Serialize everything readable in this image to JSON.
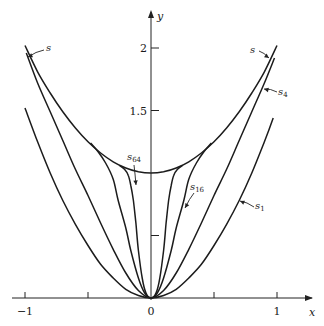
{
  "chart_data": {
    "type": "line",
    "title": "",
    "xlabel": "x",
    "ylabel": "y",
    "xlim": [
      -1,
      1
    ],
    "ylim": [
      0,
      2.1
    ],
    "grid": false,
    "legend": "none (inline arrow labels)",
    "x_ticks": [
      {
        "value": -1,
        "label": "−1"
      },
      {
        "value": -0.5,
        "label": ""
      },
      {
        "value": 0,
        "label": "0"
      },
      {
        "value": 0.5,
        "label": ""
      },
      {
        "value": 1,
        "label": "1"
      }
    ],
    "y_ticks": [
      {
        "value": 0.5,
        "label": ""
      },
      {
        "value": 1.5,
        "label": "1.5"
      },
      {
        "value": 2,
        "label": "2"
      }
    ],
    "series": [
      {
        "name": "s",
        "label_base": "s",
        "label_sub": "",
        "description": "limit / envelope curve",
        "x": [
          -1,
          -0.9,
          -0.8,
          -0.7,
          -0.6,
          -0.5,
          -0.4,
          -0.3,
          -0.2,
          -0.1,
          0,
          0.1,
          0.2,
          0.3,
          0.4,
          0.5,
          0.6,
          0.7,
          0.8,
          0.9,
          1
        ],
        "y": [
          2.02,
          1.81,
          1.64,
          1.49,
          1.36,
          1.25,
          1.16,
          1.09,
          1.04,
          1.01,
          1.0,
          1.01,
          1.04,
          1.09,
          1.16,
          1.25,
          1.36,
          1.49,
          1.64,
          1.81,
          2.02
        ]
      },
      {
        "name": "s4",
        "label_base": "s",
        "label_sub": "4",
        "x": [
          -0.99,
          -0.9,
          -0.8,
          -0.7,
          -0.6,
          -0.5,
          -0.4,
          -0.3,
          -0.2,
          -0.1,
          0,
          0.1,
          0.2,
          0.3,
          0.4,
          0.5,
          0.6,
          0.7,
          0.8,
          0.9,
          0.98
        ],
        "y": [
          1.96,
          1.72,
          1.49,
          1.26,
          1.03,
          0.82,
          0.6,
          0.39,
          0.2,
          0.06,
          0,
          0.06,
          0.2,
          0.39,
          0.6,
          0.82,
          1.03,
          1.26,
          1.49,
          1.72,
          1.92
        ]
      },
      {
        "name": "s16",
        "label_base": "s",
        "label_sub": "16",
        "x": [
          -0.48,
          -0.42,
          -0.36,
          -0.3,
          -0.26,
          -0.2,
          -0.16,
          -0.1,
          -0.05,
          0,
          0.05,
          0.1,
          0.16,
          0.2,
          0.26,
          0.3,
          0.36,
          0.42,
          0.48
        ],
        "y": [
          1.24,
          1.17,
          1.08,
          0.95,
          0.78,
          0.56,
          0.38,
          0.16,
          0.04,
          0,
          0.04,
          0.16,
          0.38,
          0.56,
          0.78,
          0.95,
          1.08,
          1.17,
          1.24
        ]
      },
      {
        "name": "s64",
        "label_base": "s",
        "label_sub": "64",
        "x": [
          -0.25,
          -0.21,
          -0.18,
          -0.16,
          -0.14,
          -0.12,
          -0.1,
          -0.07,
          -0.04,
          0,
          0.04,
          0.07,
          0.1,
          0.12,
          0.14,
          0.16,
          0.18,
          0.21,
          0.25
        ],
        "y": [
          1.06,
          1.03,
          0.98,
          0.9,
          0.78,
          0.6,
          0.38,
          0.16,
          0.04,
          0,
          0.04,
          0.16,
          0.38,
          0.6,
          0.78,
          0.9,
          0.98,
          1.03,
          1.06
        ]
      },
      {
        "name": "s1",
        "label_base": "s",
        "label_sub": "1",
        "x": [
          -1,
          -0.9,
          -0.8,
          -0.7,
          -0.6,
          -0.5,
          -0.4,
          -0.3,
          -0.2,
          -0.1,
          0,
          0.1,
          0.2,
          0.3,
          0.4,
          0.5,
          0.6,
          0.7,
          0.8,
          0.9,
          0.97
        ],
        "y": [
          1.52,
          1.25,
          1.0,
          0.78,
          0.59,
          0.42,
          0.27,
          0.16,
          0.07,
          0.02,
          0,
          0.02,
          0.07,
          0.16,
          0.27,
          0.42,
          0.59,
          0.78,
          1.0,
          1.25,
          1.44
        ]
      }
    ],
    "annotations": [
      {
        "label": "s",
        "sub": "",
        "text_px": [
          46,
          51
        ],
        "arrow_from_px": [
          44,
          50
        ],
        "arrow_to_px": [
          28,
          57
        ],
        "target": "s (left)"
      },
      {
        "label": "s",
        "sub": "",
        "text_px": [
          250,
          53
        ],
        "arrow_from_px": [
          259,
          51
        ],
        "arrow_to_px": [
          269,
          58
        ],
        "target": "s (right)"
      },
      {
        "label": "s",
        "sub": "4",
        "text_px": [
          278,
          95
        ],
        "arrow_from_px": [
          277,
          92
        ],
        "arrow_to_px": [
          264,
          89
        ],
        "target": "s4"
      },
      {
        "label": "s",
        "sub": "64",
        "text_px": [
          127,
          160
        ],
        "arrow_from_px": [
          134,
          165
        ],
        "arrow_to_px": [
          136,
          185
        ],
        "target": "s64"
      },
      {
        "label": "s",
        "sub": "16",
        "text_px": [
          190,
          190
        ],
        "arrow_from_px": [
          194,
          193
        ],
        "arrow_to_px": [
          185,
          208
        ],
        "target": "s16"
      },
      {
        "label": "s",
        "sub": "1",
        "text_px": [
          255,
          209
        ],
        "arrow_from_px": [
          254,
          207
        ],
        "arrow_to_px": [
          240,
          201
        ],
        "target": "s1"
      }
    ]
  },
  "axes": {
    "x_name": "x",
    "y_name": "y"
  }
}
